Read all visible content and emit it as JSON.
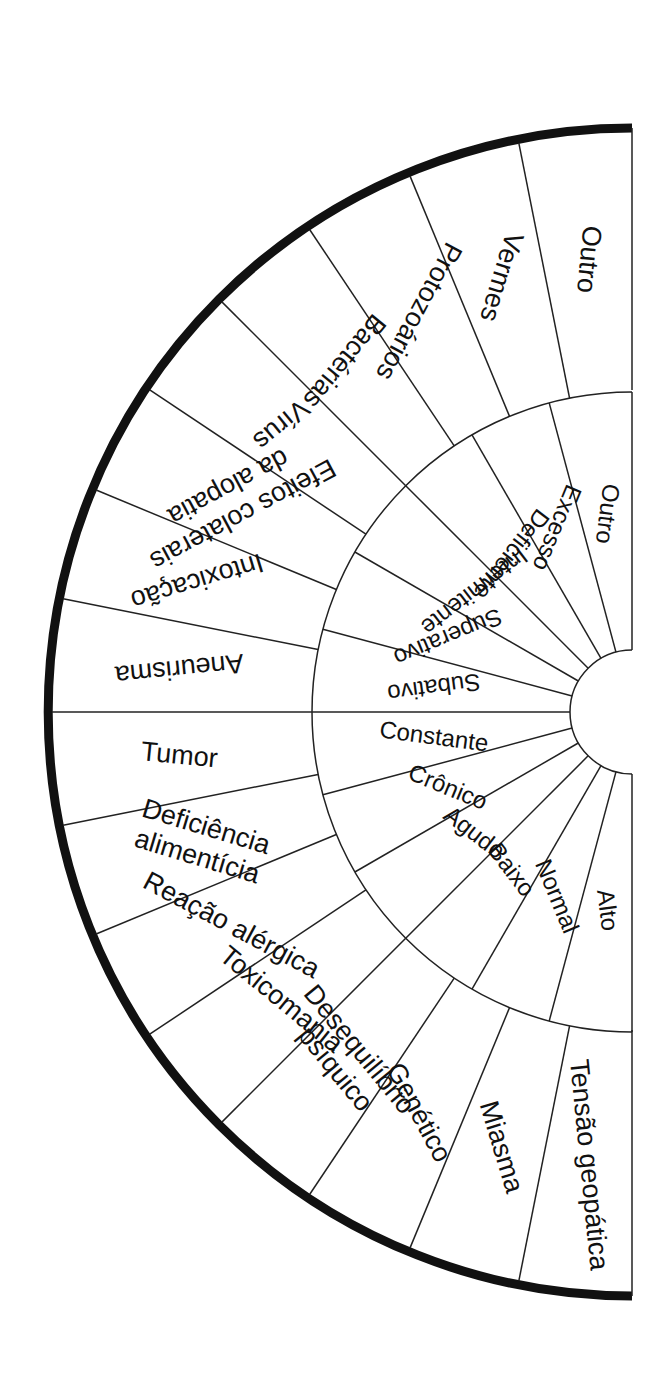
{
  "diagram": {
    "type": "radial-dial",
    "orientation": "half-circle opening right",
    "colors": {
      "line": "#222222",
      "outer_border": "#111111",
      "background": "#ffffff",
      "text": "#111111"
    },
    "outer_ring": {
      "labels": [
        {
          "text": "Outro"
        },
        {
          "text": "Vermes"
        },
        {
          "text": "Protozoários"
        },
        {
          "text": "Bactérias"
        },
        {
          "text": "Vírus"
        },
        {
          "text": "Efeitos colaterais",
          "line2": "da alopatia"
        },
        {
          "text": "Intoxicação"
        },
        {
          "text": "Aneurisma"
        },
        {
          "text": "Tumor"
        },
        {
          "text": "Deficiência",
          "line2": "alimentícia"
        },
        {
          "text": "Reação alérgica"
        },
        {
          "text": "Toxicomania"
        },
        {
          "text": "Desequilíbrio",
          "line2": "psíquico"
        },
        {
          "text": "Genético"
        },
        {
          "text": "Miasma"
        },
        {
          "text": "Tensão geopática"
        }
      ]
    },
    "middle_ring": {
      "labels": [
        {
          "text": "Outro"
        },
        {
          "text": "Excesso"
        },
        {
          "text": "Deficiente"
        },
        {
          "text": "Intermitente"
        },
        {
          "text": "Superativo"
        },
        {
          "text": "Subativo"
        },
        {
          "text": "Constante"
        },
        {
          "text": "Crônico"
        },
        {
          "text": "Agudo"
        },
        {
          "text": "Baixo"
        },
        {
          "text": "Normal"
        },
        {
          "text": "Alto"
        }
      ]
    }
  }
}
